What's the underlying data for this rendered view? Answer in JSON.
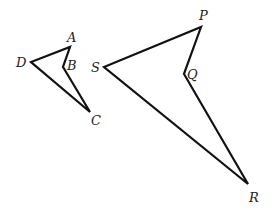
{
  "figure": {
    "small_quad": {
      "vertices": [
        {
          "label": "A",
          "x": 70,
          "y": 47,
          "lx": 67,
          "ly": 42
        },
        {
          "label": "B",
          "x": 63,
          "y": 67,
          "lx": 67,
          "ly": 70
        },
        {
          "label": "C",
          "x": 90,
          "y": 112,
          "lx": 91,
          "ly": 125
        },
        {
          "label": "D",
          "x": 31,
          "y": 62,
          "lx": 16,
          "ly": 67
        }
      ]
    },
    "large_quad": {
      "vertices": [
        {
          "label": "P",
          "x": 201,
          "y": 27,
          "lx": 199,
          "ly": 20
        },
        {
          "label": "Q",
          "x": 184,
          "y": 74,
          "lx": 187,
          "ly": 79
        },
        {
          "label": "R",
          "x": 248,
          "y": 184,
          "lx": 249,
          "ly": 202
        },
        {
          "label": "S",
          "x": 104,
          "y": 67,
          "lx": 91,
          "ly": 72
        }
      ]
    },
    "stroke_color": "#111111"
  }
}
